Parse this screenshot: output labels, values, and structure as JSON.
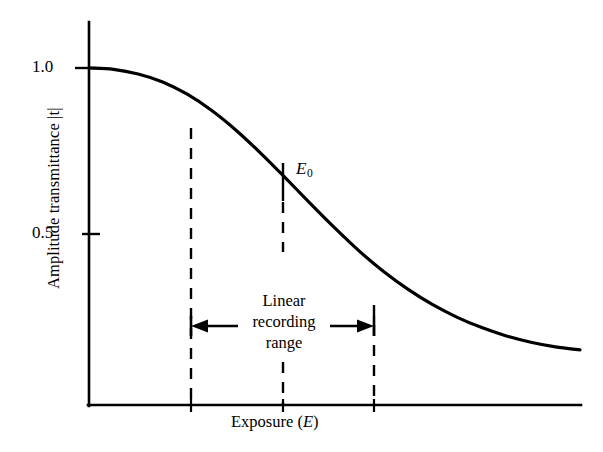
{
  "figure": {
    "background_color": "#ffffff",
    "ink_color": "#000000"
  },
  "axes": {
    "y_label": "Amplitude transmittance |t|",
    "x_label_prefix": "Exposure (",
    "x_label_var": "E",
    "x_label_suffix": ")",
    "y_ticks": [
      {
        "label": "1.0",
        "value": 1.0
      },
      {
        "label": "0.5",
        "value": 0.5
      }
    ],
    "x_ticks": []
  },
  "annotations": {
    "e0": {
      "text": "E",
      "subscript": "0"
    },
    "linear_range": {
      "line_1": "Linear",
      "line_2": "recording",
      "line_3": "range"
    }
  },
  "chart_data": {
    "type": "line",
    "title": "",
    "xlabel": "Exposure (E)",
    "ylabel": "Amplitude transmittance |t|",
    "grid": false,
    "legend": false,
    "xlim": [
      0,
      10
    ],
    "ylim": [
      0,
      1.12
    ],
    "y_tick_values": [
      0.5,
      1.0
    ],
    "y_tick_labels": [
      "0.5",
      "1.0"
    ],
    "x_tick_values": [],
    "x_tick_labels": [],
    "series": [
      {
        "name": "amplitude transmittance",
        "description": "Sigmoidal (reverse S) transmittance-vs-exposure characteristic of a photographic emulsion; flat near |t| = 1.0 at low exposure, linear through the mid region, asymptotic to a low value at high exposure.",
        "x": [
          0.0,
          0.5,
          1.0,
          1.5,
          2.0,
          2.5,
          3.0,
          3.5,
          4.0,
          4.5,
          5.0,
          5.5,
          6.0,
          6.5,
          7.0,
          7.5,
          8.0,
          8.5,
          9.0,
          9.5,
          10.0
        ],
        "y": [
          1.0,
          0.996,
          0.982,
          0.958,
          0.921,
          0.872,
          0.812,
          0.743,
          0.669,
          0.593,
          0.519,
          0.449,
          0.387,
          0.333,
          0.287,
          0.249,
          0.218,
          0.193,
          0.174,
          0.16,
          0.151
        ]
      }
    ],
    "markers": [
      {
        "name": "E0",
        "label": "E_0",
        "kind": "vertical-tick-above-curve",
        "x": 4.75,
        "curve_y": 0.556
      }
    ],
    "reference_lines": [
      {
        "name": "linear-range-left-bound",
        "kind": "dashed-vertical",
        "x": 2.0,
        "y_top": 0.921,
        "y_bottom": 0.0
      },
      {
        "name": "linear-range-center",
        "kind": "dashed-vertical",
        "x": 4.75,
        "y_top": 0.556,
        "y_bottom": 0.0
      },
      {
        "name": "linear-range-right-bound",
        "kind": "dashed-vertical",
        "x": 7.55,
        "y_top": 0.244,
        "y_bottom": 0.0
      }
    ],
    "spans": [
      {
        "name": "linear-recording-range",
        "kind": "double-headed-arrow",
        "x_start": 2.0,
        "x_end": 7.55,
        "y": 0.238,
        "label": "Linear recording range"
      }
    ]
  }
}
